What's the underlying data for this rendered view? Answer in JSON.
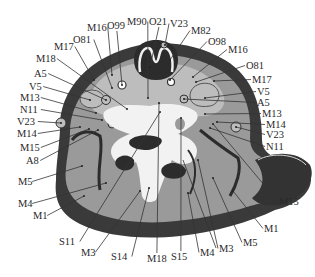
{
  "figure": {
    "type": "anatomical-cross-section",
    "colors": {
      "background": "#ffffff",
      "outer_dark": "#3a3a3a",
      "muscle_gray": "#9a9a9a",
      "light_gray": "#bdbdbd",
      "bone_white": "#f2f2f2",
      "cavity_dark": "#2c2c2c",
      "label_text": "#2a2a2a",
      "leader_line": "#333333"
    },
    "labels": [
      {
        "text": "M16",
        "x": 87,
        "y": 31,
        "tx": 112,
        "ty": 75,
        "anchor": "start"
      },
      {
        "text": "O99",
        "x": 107,
        "y": 29,
        "tx": 122,
        "ty": 85,
        "anchor": "start"
      },
      {
        "text": "M90",
        "x": 127,
        "y": 25,
        "tx": 148,
        "ty": 98,
        "anchor": "start"
      },
      {
        "text": "O21",
        "x": 149,
        "y": 25,
        "tx": 150,
        "ty": 67,
        "anchor": "start"
      },
      {
        "text": "V23",
        "x": 170,
        "y": 27,
        "tx": 165,
        "ty": 45,
        "anchor": "start"
      },
      {
        "text": "M82",
        "x": 191,
        "y": 34,
        "tx": 170,
        "ty": 60,
        "anchor": "start"
      },
      {
        "text": "O98",
        "x": 208,
        "y": 45,
        "tx": 170,
        "ty": 80,
        "anchor": "start"
      },
      {
        "text": "M16",
        "x": 228,
        "y": 53,
        "tx": 193,
        "ty": 77,
        "anchor": "start"
      },
      {
        "text": "O81",
        "x": 246,
        "y": 69,
        "tx": 196,
        "ty": 82,
        "anchor": "start"
      },
      {
        "text": "M17",
        "x": 252,
        "y": 83,
        "tx": 214,
        "ty": 81,
        "anchor": "start"
      },
      {
        "text": "V5",
        "x": 257,
        "y": 95,
        "tx": 205,
        "ty": 98,
        "anchor": "start"
      },
      {
        "text": "A5",
        "x": 257,
        "y": 106,
        "tx": 184,
        "ty": 99,
        "anchor": "start"
      },
      {
        "text": "M13",
        "x": 262,
        "y": 117,
        "tx": 205,
        "ty": 114,
        "anchor": "start"
      },
      {
        "text": "M14",
        "x": 266,
        "y": 128,
        "tx": 217,
        "ty": 122,
        "anchor": "start"
      },
      {
        "text": "V23",
        "x": 266,
        "y": 138,
        "tx": 236,
        "ty": 127,
        "anchor": "start"
      },
      {
        "text": "N11",
        "x": 266,
        "y": 150,
        "tx": 210,
        "ty": 128,
        "anchor": "start"
      },
      {
        "text": "O81",
        "x": 73,
        "y": 43,
        "tx": 112,
        "ty": 88,
        "anchor": "start"
      },
      {
        "text": "M17",
        "x": 54,
        "y": 50,
        "tx": 94,
        "ty": 80,
        "anchor": "start"
      },
      {
        "text": "M18",
        "x": 36,
        "y": 62,
        "tx": 127,
        "ty": 109,
        "anchor": "start"
      },
      {
        "text": "A5",
        "x": 34,
        "y": 77,
        "tx": 106,
        "ty": 100,
        "anchor": "start"
      },
      {
        "text": "V5",
        "x": 29,
        "y": 90,
        "tx": 90,
        "ty": 100,
        "anchor": "start"
      },
      {
        "text": "M13",
        "x": 20,
        "y": 101,
        "tx": 96,
        "ty": 113,
        "anchor": "start"
      },
      {
        "text": "N11",
        "x": 20,
        "y": 113,
        "tx": 102,
        "ty": 120,
        "anchor": "start"
      },
      {
        "text": "V23",
        "x": 17,
        "y": 125,
        "tx": 61,
        "ty": 123,
        "anchor": "start"
      },
      {
        "text": "M14",
        "x": 17,
        "y": 137,
        "tx": 80,
        "ty": 127,
        "anchor": "start"
      },
      {
        "text": "M15",
        "x": 20,
        "y": 151,
        "tx": 89,
        "ty": 129,
        "anchor": "start"
      },
      {
        "text": "A8",
        "x": 26,
        "y": 164,
        "tx": 98,
        "ty": 130,
        "anchor": "start"
      },
      {
        "text": "M5",
        "x": 18,
        "y": 185,
        "tx": 82,
        "ty": 166,
        "anchor": "start"
      },
      {
        "text": "M4",
        "x": 18,
        "y": 207,
        "tx": 106,
        "ty": 183,
        "anchor": "start"
      },
      {
        "text": "M1",
        "x": 33,
        "y": 219,
        "tx": 84,
        "ty": 196,
        "anchor": "start"
      },
      {
        "text": "S11",
        "x": 59,
        "y": 245,
        "tx": 160,
        "ty": 112,
        "anchor": "start"
      },
      {
        "text": "M3",
        "x": 81,
        "y": 256,
        "tx": 140,
        "ty": 191,
        "anchor": "start"
      },
      {
        "text": "S14",
        "x": 111,
        "y": 260,
        "tx": 149,
        "ty": 188,
        "anchor": "start"
      },
      {
        "text": "M18",
        "x": 147,
        "y": 262,
        "tx": 159,
        "ty": 103,
        "anchor": "start"
      },
      {
        "text": "S15",
        "x": 171,
        "y": 260,
        "tx": 181,
        "ty": 118,
        "anchor": "start"
      },
      {
        "text": "M4",
        "x": 200,
        "y": 256,
        "tx": 188,
        "ty": 193,
        "anchor": "start"
      },
      {
        "text": "M3",
        "x": 219,
        "y": 252,
        "tx": 198,
        "ty": 160,
        "anchor": "start"
      },
      {
        "text": "M5",
        "x": 243,
        "y": 246,
        "tx": 213,
        "ty": 178,
        "anchor": "start"
      },
      {
        "text": "M1",
        "x": 264,
        "y": 232,
        "tx": 233,
        "ty": 191,
        "anchor": "start"
      },
      {
        "text": "M15",
        "x": 279,
        "y": 205,
        "tx": 213,
        "ty": 124,
        "anchor": "start"
      }
    ],
    "extra_leaders": [
      {
        "x1": 216,
        "y1": 248,
        "x2": 183,
        "y2": 160
      }
    ]
  }
}
